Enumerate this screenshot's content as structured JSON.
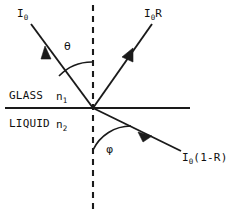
{
  "figure": {
    "stroke_color": "#1a1a1a",
    "background_color": "#ffffff"
  },
  "labels": {
    "incident_ray": {
      "base": "I",
      "sub": "0",
      "tail": ""
    },
    "reflected_ray": {
      "base": "I",
      "sub": "0",
      "tail": "R"
    },
    "refracted_ray": {
      "base": "I",
      "sub": "0",
      "tail": "(1-R)"
    },
    "incidence_angle": "θ",
    "refraction_angle": "φ",
    "upper_medium": "GLASS",
    "upper_index": {
      "base": "n",
      "sub": "1"
    },
    "lower_medium": "LIQUID",
    "lower_index": {
      "base": "n",
      "sub": "2"
    }
  },
  "geometry": {
    "interface_line": {
      "x1": 5,
      "y1": 108,
      "x2": 190,
      "y2": 108
    },
    "normal_line": {
      "x1": 93,
      "y1": 5,
      "x2": 93,
      "y2": 210,
      "dash": "6,5"
    },
    "origin": {
      "x": 93,
      "y": 108
    },
    "incident_ray": {
      "x1": 31,
      "y1": 24,
      "x2": 93,
      "y2": 108,
      "arrow_x": 49,
      "arrow_y": 57
    },
    "reflected_ray": {
      "x1": 93,
      "y1": 108,
      "x2": 152,
      "y2": 24,
      "arrow_x": 128,
      "arrow_y": 58
    },
    "refracted_ray": {
      "x1": 93,
      "y1": 108,
      "x2": 181,
      "y2": 151,
      "arrow_x": 144,
      "arrow_y": 133
    },
    "theta_arc": {
      "radius": 46
    },
    "phi_arc": {
      "radius": 42
    }
  }
}
